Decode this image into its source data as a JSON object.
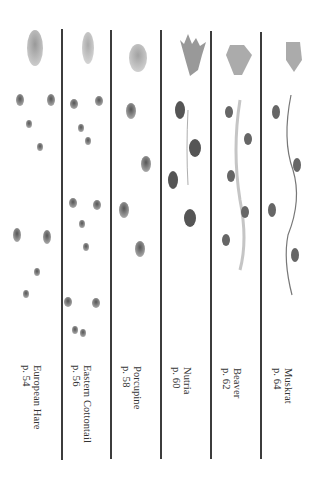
{
  "page": {
    "columns": [
      {
        "name": "European Hare",
        "page_ref": "p. 54"
      },
      {
        "name": "Eastern Cottontail",
        "page_ref": "p. 56"
      },
      {
        "name": "Porcupine",
        "page_ref": "p. 58"
      },
      {
        "name": "Nutria",
        "page_ref": "p. 60"
      },
      {
        "name": "Beaver",
        "page_ref": "p. 62"
      },
      {
        "name": "Muskrat",
        "page_ref": "p. 64"
      }
    ]
  },
  "colors": {
    "ink": "#333333",
    "divider": "#3c3c3c",
    "track": "#6a6a6a",
    "track_light": "#b5b5b5"
  }
}
